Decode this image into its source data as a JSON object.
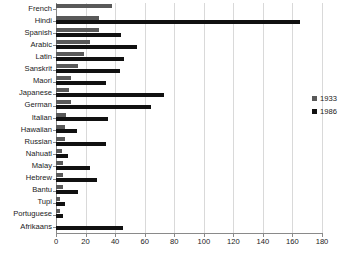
{
  "chart_data": {
    "type": "bar",
    "orientation": "horizontal",
    "title": "",
    "xlabel": "",
    "ylabel": "",
    "xlim": [
      0,
      180
    ],
    "xticks": [
      0,
      20,
      40,
      60,
      80,
      100,
      120,
      140,
      160,
      180
    ],
    "grid": true,
    "legend_position": "right",
    "categories": [
      "French",
      "Hindi",
      "Spanish",
      "Arabic",
      "Latin",
      "Sanskrit",
      "Maori",
      "Japanese",
      "German",
      "Italian",
      "Hawaiian",
      "Russian",
      "Nahuatl",
      "Malay",
      "Hebrew",
      "Bantu",
      "Tupi",
      "Portuguese",
      "Afrikaans"
    ],
    "series": [
      {
        "name": "1933",
        "color": "#595959",
        "values": [
          38,
          29,
          29,
          23,
          19,
          15,
          10,
          9,
          10,
          7,
          6,
          6,
          4,
          5,
          5,
          5,
          3,
          3,
          0
        ]
      },
      {
        "name": "1986",
        "color": "#111111",
        "values": [
          0,
          165,
          44,
          55,
          46,
          43,
          34,
          73,
          64,
          35,
          14,
          34,
          8,
          23,
          28,
          15,
          6,
          5,
          45
        ]
      }
    ]
  },
  "legend": {
    "items": [
      {
        "label": "1933",
        "color": "#595959"
      },
      {
        "label": "1986",
        "color": "#111111"
      }
    ]
  },
  "axis": {
    "x_tick_labels": [
      "0",
      "20",
      "40",
      "60",
      "80",
      "100",
      "120",
      "140",
      "160",
      "180"
    ]
  }
}
